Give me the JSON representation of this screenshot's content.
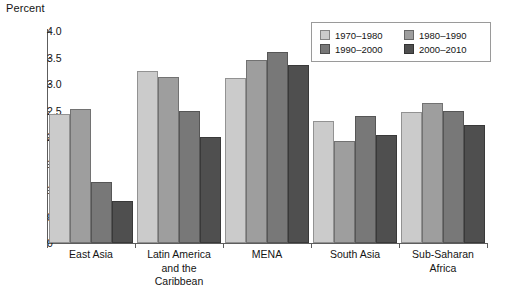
{
  "chart_data": {
    "type": "bar",
    "title": "",
    "ylabel": "Percent",
    "xlabel": "",
    "ylim": [
      0,
      4.0
    ],
    "ytick_values": [
      0,
      0.5,
      1.0,
      1.5,
      2.0,
      2.5,
      3.0,
      3.5,
      4.0
    ],
    "ytick_labels": [
      "0",
      "0.5",
      "1.0",
      "1.5",
      "2.0",
      "2.5",
      "3.0",
      "3.5",
      "4.0"
    ],
    "grid": false,
    "legend_position": "top-right",
    "categories": [
      "East Asia",
      "Latin America and the Caribbean",
      "MENA",
      "South Asia",
      "Sub-Saharan Africa"
    ],
    "category_label_lines": [
      [
        "East Asia"
      ],
      [
        "Latin America",
        "and the",
        "Caribbean"
      ],
      [
        "MENA"
      ],
      [
        "South Asia"
      ],
      [
        "Sub-Saharan",
        "Africa"
      ]
    ],
    "series": [
      {
        "name": "1970–1980",
        "color": "#cbcbcb",
        "values": [
          2.43,
          3.25,
          3.11,
          2.3,
          2.47
        ]
      },
      {
        "name": "1980–1990",
        "color": "#9e9e9e",
        "values": [
          2.53,
          3.13,
          3.45,
          1.93,
          2.65
        ]
      },
      {
        "name": "1990–2000",
        "color": "#787878",
        "values": [
          1.15,
          2.5,
          3.6,
          2.4,
          2.5
        ]
      },
      {
        "name": "2000–2010",
        "color": "#4f4f4f",
        "values": [
          0.8,
          2.0,
          3.36,
          2.03,
          2.23
        ]
      }
    ]
  },
  "colors": {
    "axis": "#5d5d5d",
    "text": "#141414",
    "legend_border": "#9a9a9a",
    "background": "#ffffff"
  }
}
